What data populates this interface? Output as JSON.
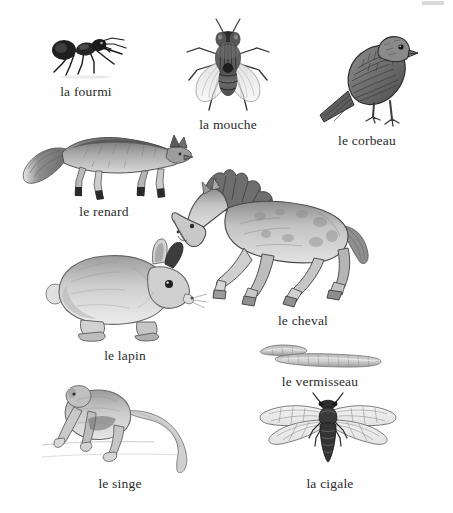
{
  "page": {
    "background_color": "#fefefe",
    "text_color": "#2b2b2b",
    "corner_mark": ""
  },
  "figures": [
    {
      "id": "ant",
      "icon": "ant-illustration",
      "label": "la fourmi",
      "caption_x": 86,
      "caption_y": 84,
      "x": 44,
      "y": 28,
      "w": 88,
      "h": 52
    },
    {
      "id": "fly",
      "icon": "fly-illustration",
      "label": "la mouche",
      "caption_x": 228,
      "caption_y": 117,
      "x": 183,
      "y": 18,
      "w": 90,
      "h": 98
    },
    {
      "id": "crow",
      "icon": "crow-illustration",
      "label": "le corbeau",
      "caption_x": 367,
      "caption_y": 133,
      "x": 318,
      "y": 33,
      "w": 100,
      "h": 98
    },
    {
      "id": "fox",
      "icon": "fox-illustration",
      "label": "le renard",
      "caption_x": 104,
      "caption_y": 204,
      "x": 18,
      "y": 123,
      "w": 175,
      "h": 80
    },
    {
      "id": "horse",
      "icon": "horse-illustration",
      "label": "le cheval",
      "caption_x": 303,
      "caption_y": 313,
      "x": 168,
      "y": 168,
      "w": 205,
      "h": 140
    },
    {
      "id": "rabbit",
      "icon": "rabbit-illustration",
      "label": "le lapin",
      "caption_x": 125,
      "caption_y": 348,
      "x": 45,
      "y": 238,
      "w": 162,
      "h": 105
    },
    {
      "id": "worm",
      "icon": "worm-illustration",
      "label": "le vermisseau",
      "caption_x": 320,
      "caption_y": 374,
      "x": 258,
      "y": 342,
      "w": 126,
      "h": 28
    },
    {
      "id": "monkey",
      "icon": "monkey-illustration",
      "label": "le singe",
      "caption_x": 120,
      "caption_y": 476,
      "x": 42,
      "y": 385,
      "w": 180,
      "h": 88
    },
    {
      "id": "cicada",
      "icon": "cicada-illustration",
      "label": "la cigale",
      "caption_x": 330,
      "caption_y": 476,
      "x": 253,
      "y": 392,
      "w": 150,
      "h": 80
    }
  ]
}
